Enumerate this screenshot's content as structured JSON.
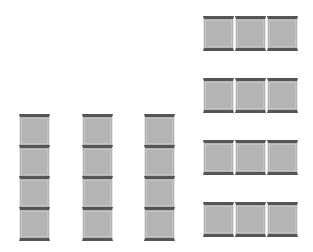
{
  "diagram": {
    "colors": {
      "tile_fill": "#b4b4b4",
      "tile_edge": "#555555",
      "background": "#ffffff"
    },
    "vertical_strips": [
      {
        "id": "v1",
        "tiles": 4
      },
      {
        "id": "v2",
        "tiles": 4
      },
      {
        "id": "v3",
        "tiles": 4
      }
    ],
    "horizontal_strips": [
      {
        "id": "h1",
        "tiles": 3
      },
      {
        "id": "h2",
        "tiles": 3
      },
      {
        "id": "h3",
        "tiles": 3
      },
      {
        "id": "h4",
        "tiles": 3
      }
    ]
  }
}
